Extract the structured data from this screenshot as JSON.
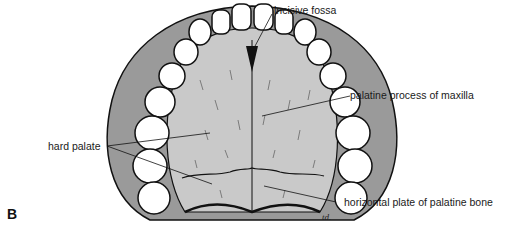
{
  "figure": {
    "panel_letter": "B",
    "signature": "td.",
    "labels": {
      "incisive_fossa": "incisive fossa",
      "palatine_process": "palatine process of maxilla",
      "hard_palate": "hard palate",
      "horizontal_plate": "horizontal plate of palatine bone"
    },
    "colors": {
      "palate_fill": "#c9c9c9",
      "tooth_fill": "#ffffff",
      "outline": "#111111",
      "gum_shade": "#8a8a8a"
    }
  }
}
